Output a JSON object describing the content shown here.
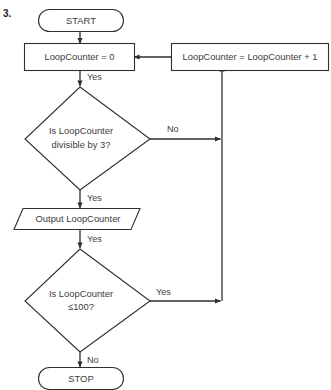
{
  "figure": {
    "index_label": "3.",
    "type": "flowchart",
    "accent_stroke": "#2f2f2f",
    "text_color": "#3b3b3b",
    "background": "#ffffff"
  },
  "nodes": {
    "start": {
      "label": "START",
      "shape": "terminator"
    },
    "init": {
      "label": "LoopCounter = 0",
      "shape": "process"
    },
    "increment": {
      "label": "LoopCounter = LoopCounter + 1",
      "shape": "process"
    },
    "decision_divisible": {
      "line1": "Is LoopCounter",
      "line2": "divisible by 3?",
      "shape": "decision"
    },
    "output": {
      "label": "Output LoopCounter",
      "shape": "input-output"
    },
    "decision_limit": {
      "line1": "Is LoopCounter",
      "line2": "≤100?",
      "shape": "decision"
    },
    "stop": {
      "label": "STOP",
      "shape": "terminator"
    }
  },
  "edge_labels": {
    "init_to_decision": "Yes",
    "divisible_no": "No",
    "divisible_yes": "Yes",
    "output_to_limit": "Yes",
    "limit_yes": "Yes",
    "limit_no": "No"
  }
}
